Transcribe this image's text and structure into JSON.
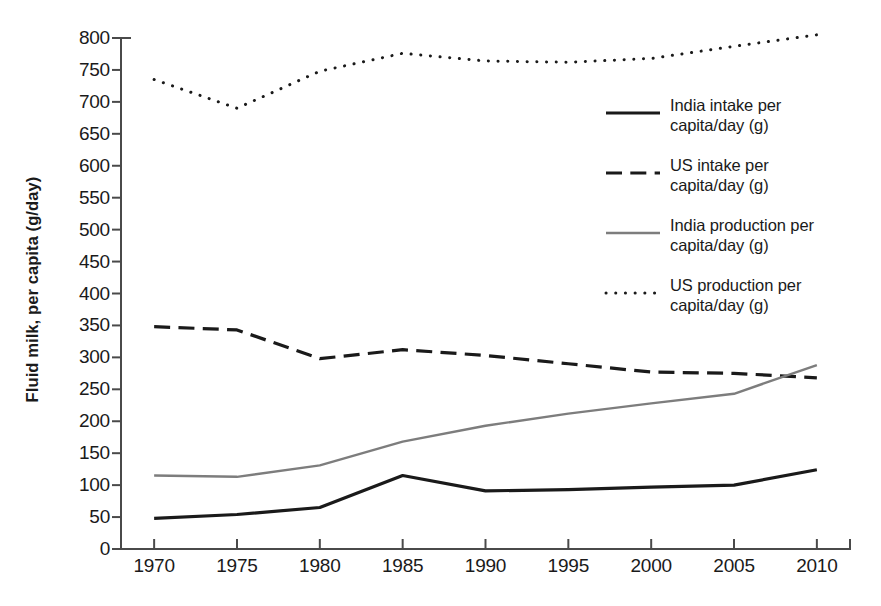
{
  "chart_data": {
    "type": "line",
    "title": "",
    "xlabel": "",
    "ylabel": "Fluid milk, per capita (g/day)",
    "x": [
      1970,
      1975,
      1980,
      1985,
      1990,
      1995,
      2000,
      2005,
      2010
    ],
    "xlim": [
      1968,
      2012
    ],
    "ylim": [
      0,
      800
    ],
    "ytick_labels": [
      "0",
      "50",
      "100",
      "150",
      "200",
      "250",
      "300",
      "350",
      "400",
      "450",
      "500",
      "550",
      "600",
      "650",
      "700",
      "750",
      "800"
    ],
    "ytick_values": [
      0,
      50,
      100,
      150,
      200,
      250,
      300,
      350,
      400,
      450,
      500,
      550,
      600,
      650,
      700,
      750,
      800
    ],
    "xtick_labels": [
      "1970",
      "1975",
      "1980",
      "1985",
      "1990",
      "1995",
      "2000",
      "2005",
      "2010"
    ],
    "grid": false,
    "legend_position": "upper right (inside, right of plot)",
    "series": [
      {
        "name": "India intake per capita/day (g)",
        "label_line1": "India intake per",
        "label_line2": "capita/day (g)",
        "style": "solid",
        "color": "#1a1a1a",
        "width": 3.2,
        "values": [
          48,
          54,
          65,
          115,
          91,
          93,
          97,
          100,
          124
        ]
      },
      {
        "name": "US intake per capita/day (g)",
        "label_line1": "US intake per",
        "label_line2": "capita/day (g)",
        "style": "dashed",
        "color": "#1a1a1a",
        "width": 3.2,
        "values": [
          348,
          343,
          298,
          312,
          303,
          290,
          277,
          275,
          268
        ]
      },
      {
        "name": "India production per capita/day (g)",
        "label_line1": "India production per",
        "label_line2": "capita/day (g)",
        "style": "solid",
        "color": "#7d7d7d",
        "width": 2.4,
        "values": [
          115,
          113,
          131,
          168,
          193,
          212,
          228,
          243,
          288
        ]
      },
      {
        "name": "US production per capita/day (g)",
        "label_line1": "US production per",
        "label_line2": "capita/day (g)",
        "style": "dotted",
        "color": "#1a1a1a",
        "width": 3.0,
        "values": [
          735,
          690,
          748,
          776,
          764,
          762,
          768,
          787,
          805
        ]
      }
    ]
  },
  "axes": {
    "y_axis_title": "Fluid milk, per capita (g/day)"
  },
  "caption": {
    "clipped_text": ""
  }
}
